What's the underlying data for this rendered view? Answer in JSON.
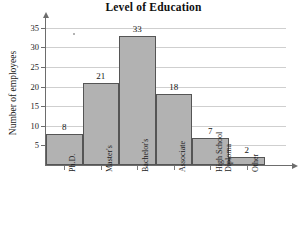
{
  "chart_data": {
    "type": "bar",
    "title": "Level of Education",
    "xlabel": "",
    "ylabel": "Number of employees",
    "categories": [
      "Ph.D.",
      "Master's",
      "Bachelor's",
      "Associate",
      "High School\nDiploma",
      "Other"
    ],
    "values": [
      8,
      21,
      33,
      18,
      7,
      2
    ],
    "ylim": [
      0,
      37
    ],
    "yticks": [
      5,
      10,
      15,
      20,
      25,
      30,
      35
    ],
    "ytick_labels": [
      "5",
      "10",
      "15",
      "20",
      "25",
      "30",
      "35"
    ],
    "value_labels": [
      "8",
      "21",
      "33",
      "18",
      "7",
      "2"
    ],
    "grid": true,
    "grid_axis": "y",
    "legend": false,
    "bar_fill_color": "#b2b2b2",
    "bar_border_color": "#555555",
    "axis_color": "#6d6d6d",
    "gridline_color": "#cfcfcf",
    "title_color": "#101010"
  }
}
